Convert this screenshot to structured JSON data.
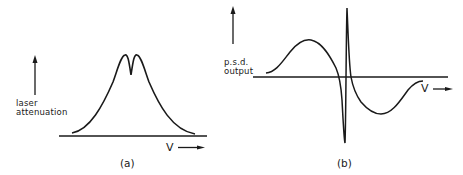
{
  "figure": {
    "panels": [
      {
        "id": "a",
        "caption": "(a)",
        "y_label_line1": "laser",
        "y_label_line2": "attenuation",
        "x_label": "V",
        "description": "Broad symmetric absorption profile with narrow central dip (Lamb dip)"
      },
      {
        "id": "b",
        "caption": "(b)",
        "y_label_line1": "p.s.d.",
        "y_label_line2": "output",
        "x_label": "V",
        "description": "Derivative-like phase-sensitive detector output with sharp central dispersion feature"
      }
    ],
    "colors": {
      "ink": "#1a1a1a",
      "background": "#ffffff"
    }
  }
}
